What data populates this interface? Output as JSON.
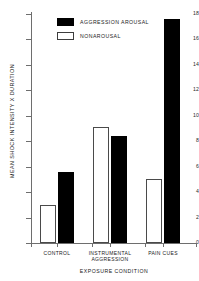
{
  "chart_data": {
    "type": "bar",
    "title": "",
    "subtitle": "",
    "xlabel": "EXPOSURE CONDITION",
    "ylabel": "MEAN SHOCK INTENSITY X DURATION",
    "categories": [
      "CONTROL",
      "INSTRUMENTAL AGGRESSION",
      "PAIN CUES"
    ],
    "category_lines": [
      [
        "CONTROL"
      ],
      [
        "INSTRUMENTAL",
        "AGGRESSION"
      ],
      [
        "PAIN CUES"
      ]
    ],
    "series": [
      {
        "name": "NONAROUSAL",
        "color": "#ffffff",
        "values": [
          3.0,
          9.1,
          5.0
        ]
      },
      {
        "name": "AGGRESSION AROUSAL",
        "color": "#000000",
        "values": [
          5.6,
          8.4,
          17.6
        ]
      }
    ],
    "ylim": [
      0,
      18
    ],
    "yticks": [
      0,
      2,
      4,
      6,
      8,
      10,
      12,
      14,
      16,
      18
    ],
    "ytick_labels": [
      "0",
      "2",
      "4",
      "6",
      "8",
      "10",
      "12",
      "14",
      "16",
      "18"
    ],
    "grid": false,
    "legend_position": "upper-left-inside",
    "legend": [
      {
        "label": "AGGRESSION AROUSAL",
        "swatch": "filled-black"
      },
      {
        "label": "NONAROUSAL",
        "swatch": "open-white"
      }
    ],
    "bar_order_in_group": [
      "NONAROUSAL",
      "AGGRESSION AROUSAL"
    ],
    "axis_color": "#6e6e6e",
    "text_color": "#1a1a1a"
  }
}
